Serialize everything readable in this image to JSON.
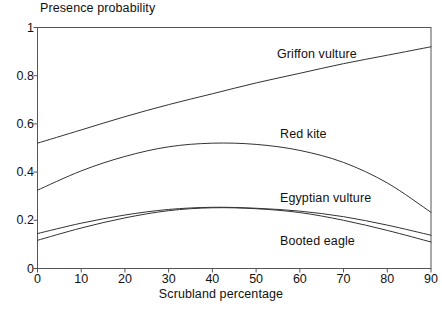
{
  "chart_data": {
    "type": "line",
    "title": "Presence probability",
    "xlabel": "Scrubland percentage",
    "ylabel": "Presence probability",
    "xlim": [
      0,
      90
    ],
    "ylim": [
      0,
      1
    ],
    "grid": false,
    "legend_position": "inline-labels",
    "xticks": [
      "0",
      "10",
      "20",
      "30",
      "40",
      "50",
      "60",
      "70",
      "80",
      "90"
    ],
    "yticks": [
      "0",
      "0.2",
      "0.4",
      "0.6",
      "0.8",
      "1"
    ],
    "x": [
      0,
      10,
      20,
      30,
      40,
      50,
      60,
      70,
      80,
      90
    ],
    "series": [
      {
        "name": "Griffon vulture",
        "label": "Griffon vulture",
        "values": [
          0.52,
          0.575,
          0.63,
          0.68,
          0.725,
          0.77,
          0.81,
          0.85,
          0.885,
          0.92
        ]
      },
      {
        "name": "Red kite",
        "label": "Red kite",
        "values": [
          0.325,
          0.405,
          0.465,
          0.505,
          0.52,
          0.515,
          0.49,
          0.44,
          0.355,
          0.233
        ]
      },
      {
        "name": "Egyptian vulture",
        "label": "Egyptian vulture",
        "values": [
          0.145,
          0.188,
          0.222,
          0.245,
          0.254,
          0.25,
          0.238,
          0.215,
          0.18,
          0.138
        ]
      },
      {
        "name": "Booted eagle",
        "label": "Booted eagle",
        "values": [
          0.117,
          0.168,
          0.21,
          0.24,
          0.252,
          0.248,
          0.232,
          0.2,
          0.158,
          0.11
        ]
      }
    ],
    "colors": {
      "axis": "#555555",
      "line": "#333333",
      "text": "#111111",
      "background": "#ffffff"
    }
  }
}
